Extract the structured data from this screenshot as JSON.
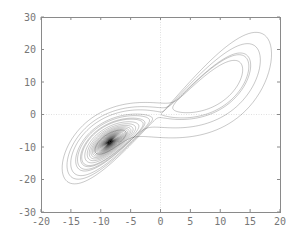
{
  "chart_data": {
    "type": "line",
    "title": "",
    "subtitle": "",
    "xlabel": "",
    "ylabel": "",
    "xlim": [
      -20,
      20
    ],
    "ylim": [
      -30,
      30
    ],
    "xticks": [
      -20,
      -15,
      -10,
      -5,
      0,
      5,
      10,
      15,
      20
    ],
    "yticks": [
      -30,
      -20,
      -10,
      0,
      10,
      20,
      30
    ],
    "xtick_labels": [
      "-20",
      "-15",
      "-10",
      "-5",
      "0",
      "5",
      "10",
      "15",
      "20"
    ],
    "ytick_labels": [
      "-30",
      "-20",
      "-10",
      "0",
      "10",
      "20",
      "30"
    ],
    "grid": false,
    "zero_lines": true,
    "legend": null,
    "series": [
      {
        "name": "trajectory",
        "color": "#222222",
        "model": "lorenz",
        "params": {
          "sigma": 10,
          "rho": 28,
          "beta": 2.6667
        },
        "initial": [
          -8.0,
          -8.5,
          27.0
        ],
        "dt": 0.005,
        "steps": 9000,
        "approx_lobe_centers": [
          [
            -8.5,
            -8.5
          ],
          [
            8.5,
            8.5
          ]
        ],
        "approx_extent": {
          "x": [
            -18,
            19
          ],
          "y": [
            -25,
            27
          ]
        }
      }
    ]
  },
  "layout": {
    "plot_left": 41,
    "plot_top": 17,
    "plot_right": 280,
    "plot_bottom": 212,
    "frame_color": "#8a8a8a",
    "label_color": "#777777"
  }
}
